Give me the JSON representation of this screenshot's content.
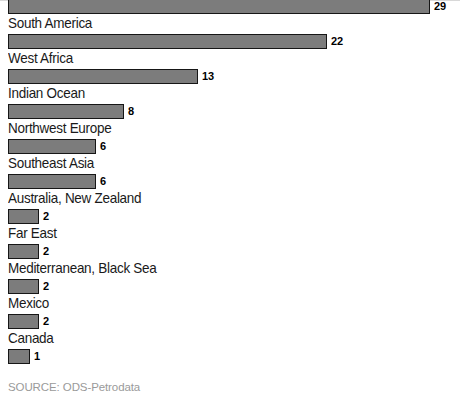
{
  "source_note": "SOURCE: ODS-Petrodata",
  "style": {
    "bar_fill": "#7c7c7c",
    "bar_border": "#161616",
    "label_color": "#1a1a1a",
    "value_color": "#000000",
    "source_color": "#9a9a9a",
    "background": "#ffffff"
  },
  "chart_data": {
    "type": "bar",
    "orientation": "horizontal",
    "title": "",
    "subtitle": "",
    "xlabel": "",
    "ylabel": "",
    "grid": false,
    "legend": false,
    "axis_visible": false,
    "value_labels": true,
    "label_position": "above-bar",
    "xlim": [
      0,
      29
    ],
    "note": "Top bar's category label is cropped off above the top edge of the image",
    "categories": [
      "",
      "South America",
      "West Africa",
      "Indian Ocean",
      "Northwest Europe",
      "Southeast Asia",
      "Australia, New Zealand",
      "Far East",
      "Mediterranean, Black Sea",
      "Mexico",
      "Canada"
    ],
    "values": [
      29,
      22,
      13,
      8,
      6,
      6,
      2,
      2,
      2,
      2,
      1
    ],
    "value_text": [
      "29",
      "22",
      "13",
      "8",
      "6",
      "6",
      "2",
      "2",
      "2",
      "2",
      "1"
    ],
    "bars": [
      {
        "category": "",
        "value": 29,
        "value_text": "29",
        "bar_px": 422
      },
      {
        "category": "South America",
        "value": 22,
        "value_text": "22",
        "bar_px": 319
      },
      {
        "category": "West Africa",
        "value": 13,
        "value_text": "13",
        "bar_px": 190
      },
      {
        "category": "Indian Ocean",
        "value": 8,
        "value_text": "8",
        "bar_px": 116
      },
      {
        "category": "Northwest Europe",
        "value": 6,
        "value_text": "6",
        "bar_px": 88
      },
      {
        "category": "Southeast Asia",
        "value": 6,
        "value_text": "6",
        "bar_px": 88
      },
      {
        "category": "Australia, New Zealand",
        "value": 2,
        "value_text": "2",
        "bar_px": 31
      },
      {
        "category": "Far East",
        "value": 2,
        "value_text": "2",
        "bar_px": 31
      },
      {
        "category": "Mediterranean, Black Sea",
        "value": 2,
        "value_text": "2",
        "bar_px": 31
      },
      {
        "category": "Mexico",
        "value": 2,
        "value_text": "2",
        "bar_px": 31
      },
      {
        "category": "Canada",
        "value": 1,
        "value_text": "1",
        "bar_px": 22
      }
    ]
  }
}
